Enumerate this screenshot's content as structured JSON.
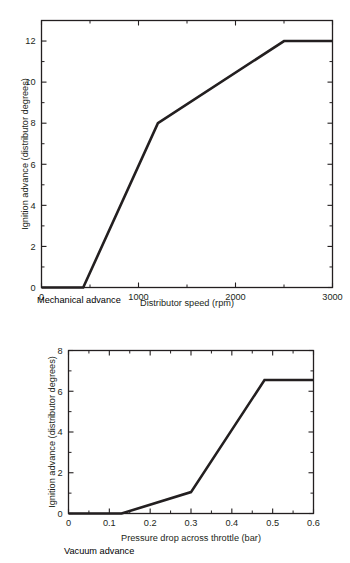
{
  "figures": [
    {
      "id": "mechanical-advance",
      "caption": "Mechanical advance"
    },
    {
      "id": "vacuum-advance",
      "caption": "Vacuum advance"
    }
  ],
  "chart_data": [
    {
      "type": "line",
      "id": "mechanical-advance",
      "title": "",
      "caption": "Mechanical advance",
      "xlabel": "Distributor speed (rpm)",
      "ylabel": "Ignition advance (distributor degrees)",
      "xlim": [
        0,
        3000
      ],
      "ylim": [
        0,
        13
      ],
      "grid": false,
      "legend": "none",
      "xticks": [
        0,
        1000,
        2000,
        3000
      ],
      "xticklabels": [
        "0",
        "1000",
        "2000",
        "3000"
      ],
      "xminorticks": [
        500,
        1500,
        2500
      ],
      "yticks": [
        0,
        2,
        4,
        6,
        8,
        10,
        12
      ],
      "yticklabels": [
        "0",
        "2",
        "4",
        "6",
        "8",
        "10",
        "12"
      ],
      "yminorticks": [
        1,
        3,
        5,
        7,
        9,
        11
      ],
      "series": [
        {
          "name": "Mechanical advance curve",
          "x": [
            0,
            430,
            1200,
            2500,
            3000
          ],
          "y": [
            0,
            0,
            8,
            12,
            12
          ]
        }
      ]
    },
    {
      "type": "line",
      "id": "vacuum-advance",
      "title": "",
      "caption": "Vacuum advance",
      "xlabel": "Pressure drop across throttle (bar)",
      "ylabel": "Ignition advance (distributor degrees)",
      "xlim": [
        0,
        0.6
      ],
      "ylim": [
        0,
        8
      ],
      "grid": false,
      "legend": "none",
      "xticks": [
        0,
        0.1,
        0.2,
        0.3,
        0.4,
        0.5,
        0.6
      ],
      "xticklabels": [
        "0",
        "0.1",
        "0.2",
        "0.3",
        "0.4",
        "0.5",
        "0.6"
      ],
      "xminorticks": [
        0.05,
        0.15,
        0.25,
        0.35,
        0.45,
        0.55
      ],
      "yticks": [
        0,
        2,
        4,
        6,
        8
      ],
      "yticklabels": [
        "0",
        "2",
        "4",
        "6",
        "8"
      ],
      "yminorticks": [
        1,
        3,
        5,
        7
      ],
      "series": [
        {
          "name": "Vacuum advance curve",
          "x": [
            0,
            0.13,
            0.3,
            0.48,
            0.6
          ],
          "y": [
            0,
            0,
            1.05,
            6.55,
            6.55
          ]
        }
      ]
    }
  ],
  "colors": {
    "ink": "#231f20",
    "background": "#ffffff"
  }
}
